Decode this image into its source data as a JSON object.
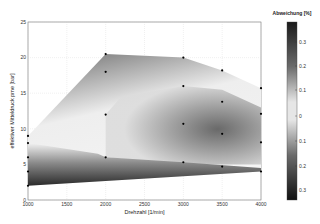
{
  "chart_data": {
    "type": "heatmap",
    "title": "",
    "xlabel": "Drehzahl [1/min]",
    "ylabel": "effektiver Mitteldruck pme [bar]",
    "xlim": [
      1000,
      4000
    ],
    "ylim": [
      0,
      25
    ],
    "xticks": [
      "1000",
      "1500",
      "2000",
      "2500",
      "3000",
      "3500",
      "4000"
    ],
    "yticks": [
      "0",
      "5",
      "10",
      "15",
      "20",
      "25"
    ],
    "grid": true,
    "colorbar": {
      "title": "Abweichung [%]",
      "ticks": [
        "0.3",
        "0.2",
        "0.1",
        "0",
        "0.1",
        "0.2",
        "0.3"
      ],
      "colormap": "gray"
    },
    "measurement_points": [
      {
        "x": 1000,
        "y": 9
      },
      {
        "x": 1000,
        "y": 8
      },
      {
        "x": 1000,
        "y": 6
      },
      {
        "x": 1000,
        "y": 4
      },
      {
        "x": 1000,
        "y": 2
      },
      {
        "x": 2000,
        "y": 20.5
      },
      {
        "x": 2000,
        "y": 18
      },
      {
        "x": 2000,
        "y": 12
      },
      {
        "x": 2000,
        "y": 6
      },
      {
        "x": 3000,
        "y": 20
      },
      {
        "x": 3000,
        "y": 16
      },
      {
        "x": 3000,
        "y": 10.7
      },
      {
        "x": 3000,
        "y": 5.3
      },
      {
        "x": 3500,
        "y": 18.2
      },
      {
        "x": 3500,
        "y": 13.8
      },
      {
        "x": 3500,
        "y": 9.3
      },
      {
        "x": 3500,
        "y": 4.7
      },
      {
        "x": 4000,
        "y": 15.7
      },
      {
        "x": 4000,
        "y": 12.1
      },
      {
        "x": 4000,
        "y": 8.1
      },
      {
        "x": 4000,
        "y": 4
      }
    ],
    "envelope": [
      {
        "x": 1000,
        "y": 9
      },
      {
        "x": 2000,
        "y": 20.5
      },
      {
        "x": 3000,
        "y": 20
      },
      {
        "x": 3500,
        "y": 18.2
      },
      {
        "x": 4000,
        "y": 15.7
      },
      {
        "x": 4000,
        "y": 4
      },
      {
        "x": 1000,
        "y": 2
      }
    ]
  }
}
